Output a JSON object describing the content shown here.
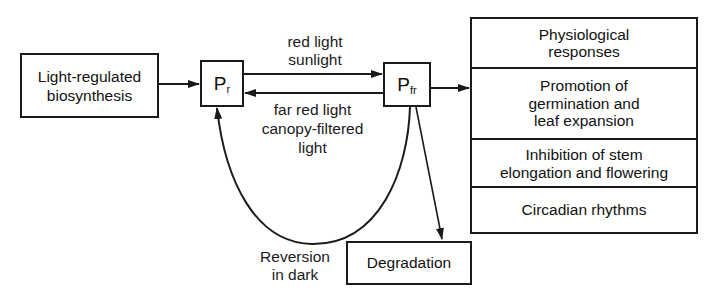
{
  "diagram": {
    "type": "phytochrome-photoconversion-flow",
    "nodes": {
      "biosynthesis": {
        "label": "Light-regulated\nbiosynthesis"
      },
      "pr": {
        "label": "P",
        "subscript": "r"
      },
      "pfr": {
        "label": "P",
        "subscript": "fr"
      },
      "degradation": {
        "label": "Degradation"
      }
    },
    "edges": {
      "pr_to_pfr": {
        "label": "red light\nsunlight"
      },
      "pfr_to_pr": {
        "label": "far red light\ncanopy-filtered\nlight"
      },
      "dark_reversion": {
        "label": "Reversion\nin dark"
      }
    },
    "responses": {
      "header": "Physiological\nresponses",
      "items": [
        "Promotion of\ngermination and\nleaf expansion",
        "Inhibition of stem\nelongation and flowering",
        "Circadian rhythms"
      ]
    },
    "colors": {
      "stroke": "#1a1a1a",
      "background": "#ffffff"
    }
  }
}
